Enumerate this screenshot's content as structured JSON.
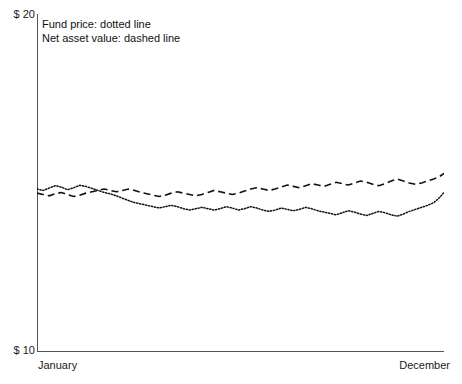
{
  "chart_data": {
    "type": "line",
    "title": "",
    "subtitle": "",
    "xlabel": "",
    "ylabel": "",
    "grid": false,
    "legend_position": "top-left-inside",
    "ylim": [
      10,
      20
    ],
    "y_ticks": [
      "$ 10",
      "$ 20"
    ],
    "x_ticks": [
      "January",
      "December"
    ],
    "xlim": [
      "January",
      "December"
    ],
    "series": [
      {
        "name": "Fund price",
        "style": "dotted",
        "color": "#111111",
        "x": [
          0,
          1.5,
          3,
          4.5,
          6,
          7.5,
          9,
          10.5,
          12,
          13.5,
          15,
          16.5,
          18,
          19.5,
          21,
          22.5,
          24,
          25.5,
          27,
          28.5,
          30,
          31.5,
          33,
          34.5,
          36,
          37.5,
          39,
          40.5,
          42,
          43.5,
          45,
          46.5,
          48,
          49.5,
          51,
          52.5,
          54,
          55.5,
          57,
          58.5,
          60,
          61.5,
          63,
          64.5,
          66,
          67.5,
          69,
          70.5,
          72,
          73.5,
          75,
          76.5,
          78,
          79.5,
          81,
          82.5,
          84,
          85.5,
          87,
          88.5,
          90,
          91.5,
          93,
          94.5,
          96,
          97.5,
          99,
          100
        ],
        "values": [
          14.82,
          14.78,
          14.85,
          14.92,
          14.88,
          14.8,
          14.86,
          14.93,
          14.9,
          14.84,
          14.78,
          14.72,
          14.68,
          14.62,
          14.55,
          14.48,
          14.42,
          14.38,
          14.34,
          14.3,
          14.26,
          14.3,
          14.34,
          14.3,
          14.24,
          14.2,
          14.24,
          14.28,
          14.24,
          14.2,
          14.24,
          14.3,
          14.26,
          14.2,
          14.24,
          14.3,
          14.26,
          14.2,
          14.16,
          14.2,
          14.26,
          14.22,
          14.18,
          14.22,
          14.28,
          14.24,
          14.18,
          14.14,
          14.1,
          14.06,
          14.12,
          14.18,
          14.14,
          14.08,
          14.04,
          14.1,
          14.16,
          14.12,
          14.06,
          14.02,
          14.08,
          14.16,
          14.22,
          14.28,
          14.34,
          14.42,
          14.58,
          14.72
        ]
      },
      {
        "name": "Net asset value",
        "style": "dashed",
        "color": "#111111",
        "x": [
          0,
          1.5,
          3,
          4.5,
          6,
          7.5,
          9,
          10.5,
          12,
          13.5,
          15,
          16.5,
          18,
          19.5,
          21,
          22.5,
          24,
          25.5,
          27,
          28.5,
          30,
          31.5,
          33,
          34.5,
          36,
          37.5,
          39,
          40.5,
          42,
          43.5,
          45,
          46.5,
          48,
          49.5,
          51,
          52.5,
          54,
          55.5,
          57,
          58.5,
          60,
          61.5,
          63,
          64.5,
          66,
          67.5,
          69,
          70.5,
          72,
          73.5,
          75,
          76.5,
          78,
          79.5,
          81,
          82.5,
          84,
          85.5,
          87,
          88.5,
          90,
          91.5,
          93,
          94.5,
          96,
          97.5,
          99,
          100
        ],
        "values": [
          14.7,
          14.66,
          14.62,
          14.68,
          14.72,
          14.66,
          14.6,
          14.64,
          14.7,
          14.74,
          14.78,
          14.82,
          14.78,
          14.74,
          14.78,
          14.82,
          14.78,
          14.72,
          14.68,
          14.64,
          14.6,
          14.64,
          14.7,
          14.74,
          14.7,
          14.66,
          14.62,
          14.66,
          14.72,
          14.78,
          14.74,
          14.7,
          14.66,
          14.7,
          14.76,
          14.82,
          14.86,
          14.82,
          14.78,
          14.82,
          14.88,
          14.94,
          14.9,
          14.86,
          14.92,
          14.98,
          14.94,
          14.9,
          14.96,
          15.02,
          14.98,
          14.94,
          15.0,
          15.06,
          15.02,
          14.96,
          14.92,
          14.98,
          15.06,
          15.12,
          15.06,
          15.0,
          14.96,
          15.0,
          15.06,
          15.12,
          15.2,
          15.28
        ]
      }
    ],
    "annotations": [
      "Fund price: dotted line",
      "Net asset value: dashed line"
    ]
  },
  "axes": {
    "y_top": "$ 20",
    "y_bottom": "$ 10",
    "x_start": "January",
    "x_end": "December"
  },
  "legend": {
    "line1": "Fund price: dotted line",
    "line2": "Net asset value: dashed line"
  }
}
